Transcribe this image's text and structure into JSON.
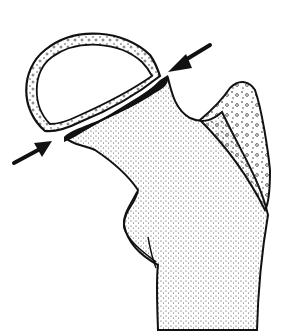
{
  "figure": {
    "subject": "Line illustration of proximal femur with separated femoral head fragment",
    "parts": {
      "femoral_head": "femoral-head-fragment",
      "fracture_line": "black fracture gap along neck",
      "greater_trochanter": "trochanter region with coarse stipple",
      "femoral_neck_shaft": "stippled neck and shaft",
      "lesser_trochanter": "small bump on medial shaft"
    },
    "arrows": [
      {
        "name": "upper-right-arrow",
        "direction": "pointing down-left to fracture"
      },
      {
        "name": "lower-left-arrow",
        "direction": "pointing up-right to fracture"
      }
    ],
    "colors": {
      "ink": "#111111",
      "background": "#ffffff"
    }
  }
}
